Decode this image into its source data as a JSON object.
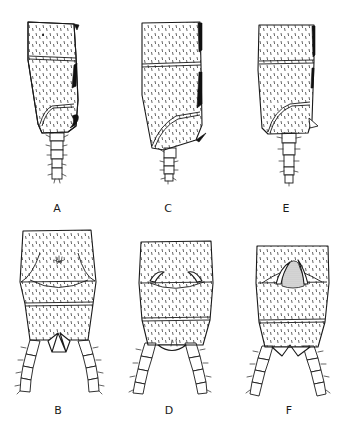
{
  "plate": {
    "background": "#ffffff",
    "ink_color": "#1a1a1a",
    "figures": [
      {
        "id": "A",
        "label": "A",
        "view": "lateral",
        "label_x": 57,
        "label_y": 203
      },
      {
        "id": "C",
        "label": "C",
        "view": "lateral",
        "label_x": 168,
        "label_y": 203
      },
      {
        "id": "E",
        "label": "E",
        "view": "lateral",
        "label_x": 286,
        "label_y": 203
      },
      {
        "id": "B",
        "label": "B",
        "view": "dorsal",
        "label_x": 58,
        "label_y": 405
      },
      {
        "id": "D",
        "label": "D",
        "view": "dorsal",
        "label_x": 169,
        "label_y": 405
      },
      {
        "id": "F",
        "label": "F",
        "view": "dorsal",
        "label_x": 289,
        "label_y": 405
      }
    ]
  }
}
